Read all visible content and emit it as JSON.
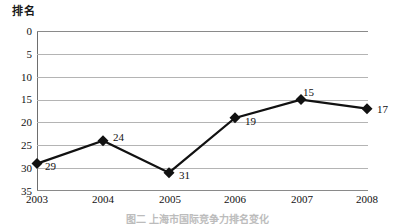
{
  "chart_data": {
    "type": "line",
    "title": "",
    "subtitle": "",
    "xlabel": "",
    "ylabel": "排名",
    "categories": [
      "2003",
      "2004",
      "2005",
      "2006",
      "2007",
      "2008"
    ],
    "values": [
      29,
      24,
      31,
      19,
      15,
      17
    ],
    "point_labels": [
      "29",
      "24",
      "31",
      "19",
      "15",
      "17"
    ],
    "series": [
      {
        "name": "排名",
        "values": [
          29,
          24,
          31,
          19,
          15,
          17
        ],
        "color": "#111111",
        "marker": "diamond"
      }
    ],
    "ylim": [
      0,
      35
    ],
    "y_inverted": true,
    "yticks": [
      0,
      5,
      10,
      15,
      20,
      25,
      30,
      35
    ],
    "ytick_labels": [
      "0",
      "5",
      "10",
      "15",
      "20",
      "25",
      "30",
      "35"
    ],
    "xtick_labels": [
      "2003",
      "2004",
      "2005",
      "2006",
      "2007",
      "2008"
    ],
    "grid": "horizontal",
    "legend": "none",
    "line_color": "#111111",
    "grid_color": "#b4b4b4",
    "axis_color": "#6e6e6e"
  },
  "caption": {
    "text": "图二  上海市国际竞争力排名变化"
  }
}
